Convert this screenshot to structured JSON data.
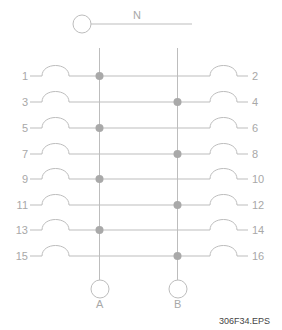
{
  "diagram": {
    "neutral": {
      "label": "N"
    },
    "buses": [
      {
        "label": "A",
        "x": 99.5
      },
      {
        "label": "B",
        "x": 177.5
      }
    ],
    "rows": [
      {
        "left": "1",
        "right": "2",
        "y": 76,
        "bus": "A"
      },
      {
        "left": "3",
        "right": "4",
        "y": 102,
        "bus": "B"
      },
      {
        "left": "5",
        "right": "6",
        "y": 128,
        "bus": "A"
      },
      {
        "left": "7",
        "right": "8",
        "y": 154,
        "bus": "B"
      },
      {
        "left": "9",
        "right": "10",
        "y": 179,
        "bus": "A"
      },
      {
        "left": "11",
        "right": "12",
        "y": 205,
        "bus": "B"
      },
      {
        "left": "13",
        "right": "14",
        "y": 230,
        "bus": "A"
      },
      {
        "left": "15",
        "right": "16",
        "y": 256,
        "bus": "B"
      }
    ],
    "figure_id": "306F34.EPS",
    "colors": {
      "wire": "#bdbdbd",
      "node": "#a9a9a9",
      "label": "#a8a8a8",
      "figure_id": "#444444"
    }
  }
}
